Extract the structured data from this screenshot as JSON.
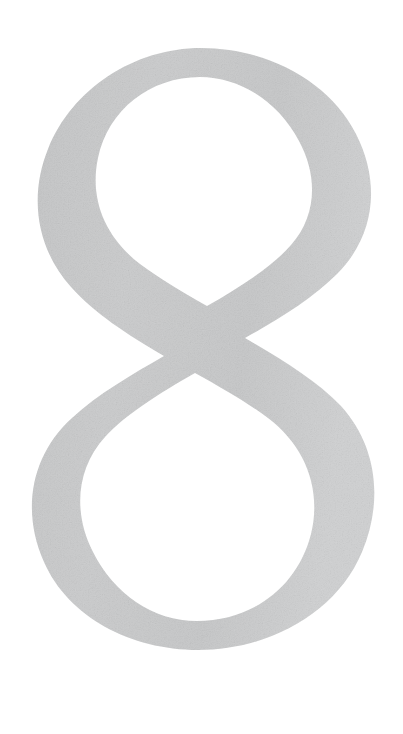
{
  "canvas": {
    "width": 403,
    "height": 734,
    "background_color": "#FFFFFF",
    "description": "Single large light-gray numeral on a plain white page"
  },
  "artwork": {
    "name": "numeral-eight",
    "character": "8",
    "alt_text": "Large light gray numeral 8",
    "style": "high-contrast didone / calligraphic crossing-stroke figure eight",
    "fill_color": "#CCCCCC",
    "fill_color_light": "#D6D7D8",
    "fill_color_dark": "#C4C5C6",
    "texture": "subtle paper grain",
    "bounds": {
      "left": 30,
      "top": 48,
      "right": 370,
      "bottom": 688,
      "width": 340,
      "height": 640
    },
    "parts": [
      {
        "name": "upper-bowl",
        "label": "Upper bowl",
        "counter_shape": "teardrop",
        "center_x": 205,
        "center_y": 195
      },
      {
        "name": "lower-bowl",
        "label": "Lower bowl",
        "counter_shape": "egg",
        "center_x": 196,
        "center_y": 545
      },
      {
        "name": "waist-cross",
        "label": "Crossing strokes at waist",
        "center_x": 200,
        "center_y": 358
      }
    ],
    "stroke_contrast": {
      "thick_max_px": 62,
      "thin_min_px": 26
    }
  }
}
